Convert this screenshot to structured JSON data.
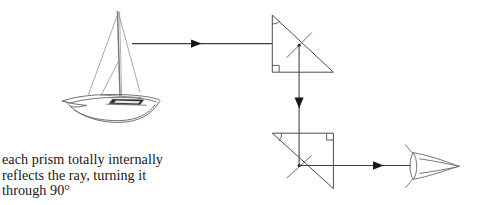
{
  "figure": {
    "title": "Total internal reflection in two prisms directing light from a boat to an eye",
    "caption_text": "each prism totally internally\nreflects the ray, turning it\nthrough 90°",
    "caption_lines": [
      "each prism totally internally",
      "reflects the ray, turning it",
      "through 90°"
    ],
    "colors": {
      "line": "#3b3b40",
      "prism_edge": "#4a4a50",
      "boat_outline": "#6e6e74",
      "eye_outline": "#6e6e74",
      "text": "#18181a",
      "background": "#ffffff"
    },
    "objects": {
      "boat": {
        "label": "sailboat",
        "description": "sailboat with mast and rigging viewed in perspective"
      },
      "eye": {
        "label": "eye",
        "description": "observer eye symbol receiving the ray"
      },
      "prism_top": {
        "label": "upper prism",
        "right_angle_marker": "90",
        "apex_angle_marker": "45",
        "orientation": "right angle at lower-left, hypotenuse from top-left to bottom-right"
      },
      "prism_bottom": {
        "label": "lower prism",
        "right_angle_marker": "90",
        "apex_angle_marker": "45",
        "orientation": "right angle at upper-right, hypotenuse from top-left to bottom-right"
      }
    },
    "rays": {
      "incoming": {
        "label": "incoming ray from boat",
        "direction": "rightward"
      },
      "between_prisms": {
        "label": "ray between prisms",
        "direction": "downward"
      },
      "outgoing": {
        "label": "ray to eye",
        "direction": "rightward"
      },
      "normal_top": {
        "label": "normal at upper reflection point"
      },
      "normal_bottom": {
        "label": "normal at lower reflection point"
      }
    }
  }
}
